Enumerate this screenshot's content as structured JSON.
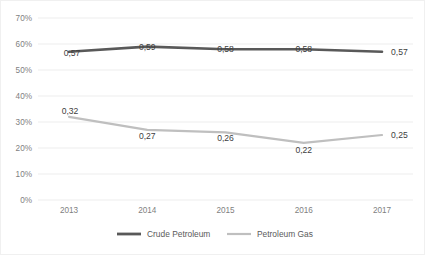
{
  "chart_data": {
    "type": "line",
    "title": "",
    "subtitle": "",
    "xlabel": "",
    "ylabel": "",
    "categories": [
      "2013",
      "2014",
      "2015",
      "2016",
      "2017"
    ],
    "x": [
      2013,
      2014,
      2015,
      2016,
      2017
    ],
    "ylim": [
      0,
      0.7
    ],
    "yticks": [
      "0%",
      "10%",
      "20%",
      "30%",
      "40%",
      "50%",
      "60%",
      "70%"
    ],
    "ytick_values": [
      0,
      0.1,
      0.2,
      0.3,
      0.4,
      0.5,
      0.6,
      0.7
    ],
    "grid": true,
    "legend_position": "bottom",
    "decimal_separator": ",",
    "series": [
      {
        "name": "Crude Petroleum",
        "color": "#595959",
        "line_width": 2.6,
        "values": [
          0.57,
          0.59,
          0.58,
          0.58,
          0.57
        ],
        "labels": [
          "0,57",
          "0,59",
          "0,58",
          "0,58",
          "0,57"
        ]
      },
      {
        "name": "Petroleum Gas",
        "color": "#bfbfbf",
        "line_width": 2.2,
        "values": [
          0.32,
          0.27,
          0.26,
          0.22,
          0.25
        ],
        "labels": [
          "0,32",
          "0,27",
          "0,26",
          "0,22",
          "0,25"
        ]
      }
    ]
  },
  "legend": {
    "items": [
      {
        "label": "Crude Petroleum",
        "color": "#595959"
      },
      {
        "label": "Petroleum Gas",
        "color": "#bfbfbf"
      }
    ]
  },
  "axes": {
    "y_labels": [
      "70%",
      "60%",
      "50%",
      "40%",
      "30%",
      "20%",
      "10%",
      "0%"
    ],
    "x_labels": [
      "2013",
      "2014",
      "2015",
      "2016",
      "2017"
    ]
  }
}
